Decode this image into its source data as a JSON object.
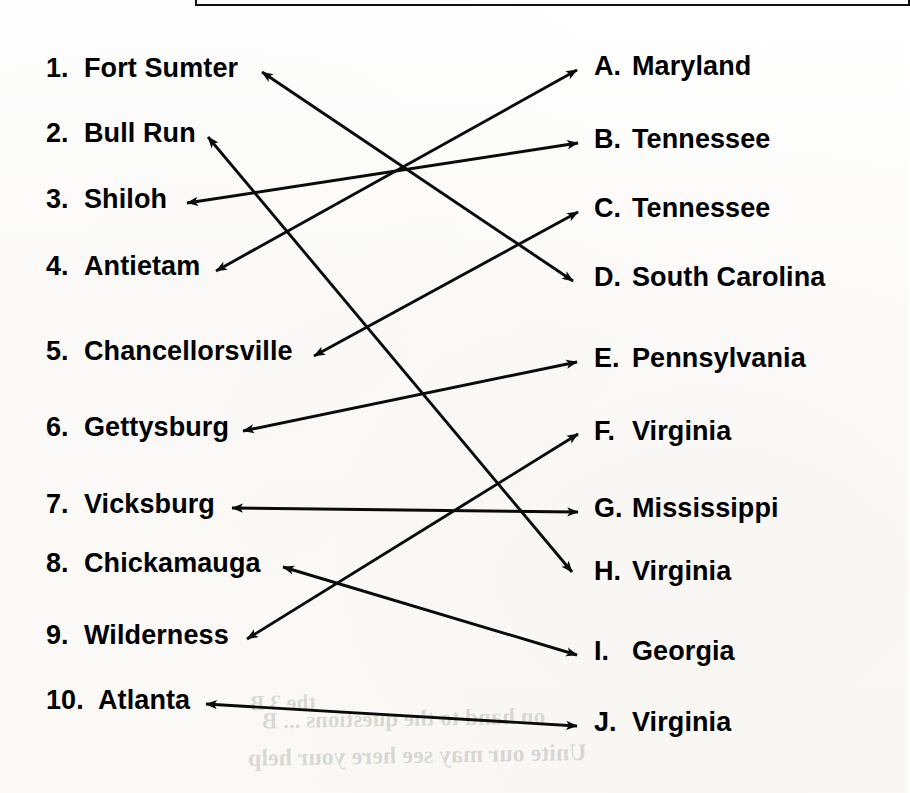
{
  "page": {
    "type": "matching-worksheet",
    "width": 908,
    "height": 793,
    "ink_color": "#000000",
    "paper_color": "#fdfdfc"
  },
  "left_column": {
    "heading": "",
    "items": [
      {
        "number": "1.",
        "label": "Fort Sumter"
      },
      {
        "number": "2.",
        "label": "Bull Run"
      },
      {
        "number": "3.",
        "label": "Shiloh"
      },
      {
        "number": "4.",
        "label": "Antietam"
      },
      {
        "number": "5.",
        "label": "Chancellorsville"
      },
      {
        "number": "6.",
        "label": "Gettysburg"
      },
      {
        "number": "7.",
        "label": "Vicksburg"
      },
      {
        "number": "8.",
        "label": "Chickamauga"
      },
      {
        "number": "9.",
        "label": "Wilderness"
      },
      {
        "number": "10.",
        "label": "Atlanta"
      }
    ]
  },
  "right_column": {
    "heading": "",
    "items": [
      {
        "letter": "A.",
        "label": "Maryland"
      },
      {
        "letter": "B.",
        "label": "Tennessee"
      },
      {
        "letter": "C.",
        "label": "Tennessee"
      },
      {
        "letter": "D.",
        "label": "South Carolina"
      },
      {
        "letter": "E.",
        "label": "Pennsylvania"
      },
      {
        "letter": "F.",
        "label": "Virginia"
      },
      {
        "letter": "G.",
        "label": "Mississippi"
      },
      {
        "letter": "H.",
        "label": "Virginia"
      },
      {
        "letter": "I.",
        "label": "Georgia"
      },
      {
        "letter": "J.",
        "label": "Virginia"
      }
    ]
  },
  "connections": [
    {
      "from": "1",
      "to": "D",
      "from_label": "Fort Sumter",
      "to_label": "South Carolina",
      "x1": 262,
      "y1": 72,
      "x2": 573,
      "y2": 281,
      "head": "both"
    },
    {
      "from": "2",
      "to": "H",
      "from_label": "Bull Run",
      "to_label": "Virginia",
      "x1": 208,
      "y1": 137,
      "x2": 572,
      "y2": 572,
      "head": "both"
    },
    {
      "from": "3",
      "to": "B",
      "from_label": "Shiloh",
      "to_label": "Tennessee",
      "x1": 187,
      "y1": 203,
      "x2": 578,
      "y2": 143,
      "head": "both"
    },
    {
      "from": "4",
      "to": "A",
      "from_label": "Antietam",
      "to_label": "Maryland",
      "x1": 216,
      "y1": 271,
      "x2": 577,
      "y2": 70,
      "head": "both"
    },
    {
      "from": "5",
      "to": "C",
      "from_label": "Chancellorsville",
      "to_label": "Tennessee",
      "x1": 314,
      "y1": 356,
      "x2": 578,
      "y2": 212,
      "head": "both"
    },
    {
      "from": "6",
      "to": "E",
      "from_label": "Gettysburg",
      "to_label": "Pennsylvania",
      "x1": 243,
      "y1": 431,
      "x2": 577,
      "y2": 362,
      "head": "both"
    },
    {
      "from": "7",
      "to": "G",
      "from_label": "Vicksburg",
      "to_label": "Mississippi",
      "x1": 232,
      "y1": 508,
      "x2": 578,
      "y2": 512,
      "head": "both"
    },
    {
      "from": "8",
      "to": "I",
      "from_label": "Chickamauga",
      "to_label": "Georgia",
      "x1": 283,
      "y1": 567,
      "x2": 577,
      "y2": 655,
      "head": "both"
    },
    {
      "from": "9",
      "to": "F",
      "from_label": "Wilderness",
      "to_label": "Virginia",
      "x1": 247,
      "y1": 639,
      "x2": 578,
      "y2": 434,
      "head": "both"
    },
    {
      "from": "10",
      "to": "J",
      "from_label": "Atlanta",
      "to_label": "Virginia",
      "x1": 206,
      "y1": 704,
      "x2": 577,
      "y2": 726,
      "head": "both"
    }
  ],
  "bleed_through_text": [
    {
      "text": "the 3 B",
      "x": 250,
      "y": 690,
      "size": 22,
      "rot": -1
    },
    {
      "text": "on hand to the questions ... B",
      "x": 262,
      "y": 706,
      "size": 23,
      "rot": -1
    },
    {
      "text": "Unite our may see here your help",
      "x": 248,
      "y": 742,
      "size": 24,
      "rot": -1
    }
  ]
}
